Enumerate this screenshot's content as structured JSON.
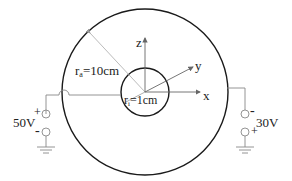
{
  "diagram": {
    "labels": {
      "outer_radius": "r",
      "outer_radius_sub": "a",
      "outer_radius_value": "=10cm",
      "inner_radius": "r",
      "inner_radius_sub": "i",
      "inner_radius_value": "=1cm",
      "axis_x": "x",
      "axis_y": "y",
      "axis_z": "z"
    },
    "left_source": {
      "voltage": "50V",
      "top_sign": "+",
      "bottom_sign": "-"
    },
    "right_source": {
      "voltage": "30V",
      "top_sign": "-",
      "bottom_sign": "+"
    },
    "colors": {
      "shell": "#1a1a1a",
      "wire": "#888888"
    }
  }
}
